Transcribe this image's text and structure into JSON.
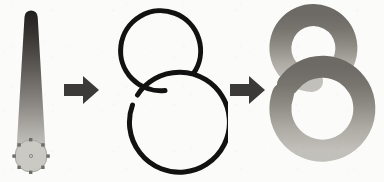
{
  "figure": {
    "background_color": "#fbfbf9",
    "width": 384,
    "height": 182,
    "panel_count": 3,
    "connector_count": 2
  },
  "panels": [
    {
      "id": "source",
      "name": "gradient-brush-stroke",
      "label": "Tapered gradient stroke with selected round end cap",
      "shape": "tapered-bar",
      "gradient": {
        "direction": "top-to-bottom",
        "stops": [
          {
            "offset": "0%",
            "color": "#211f1e"
          },
          {
            "offset": "18%",
            "color": "#383533"
          },
          {
            "offset": "42%",
            "color": "#5f5b57"
          },
          {
            "offset": "68%",
            "color": "#8d8a85"
          },
          {
            "offset": "88%",
            "color": "#b3b1ac"
          },
          {
            "offset": "100%",
            "color": "#c9c7c2"
          }
        ]
      },
      "top_width": 13,
      "bottom_width": 26,
      "selection": {
        "name": "selection-handles",
        "visible": true,
        "handle_color": "#6f6d69",
        "handle_count": 8,
        "center_marker": true,
        "circle_fill": "#cbc9c4",
        "circle_stroke": "#a8a6a1",
        "circle_radius": 16
      }
    },
    {
      "id": "path",
      "name": "figure-eight-outline-path",
      "label": "Open figure-eight outline path",
      "shape": "figure-eight",
      "stroke_color": "#131212",
      "stroke_width": 5,
      "fill": "none",
      "upper_loop": {
        "cx": 58,
        "cy": 52,
        "r": 40,
        "gap": "lower-right"
      },
      "lower_loop": {
        "cx": 55,
        "cy": 128,
        "r": 50,
        "gap": "upper-left"
      }
    },
    {
      "id": "result",
      "name": "gradient-applied-figure-eight",
      "label": "Gradient stroke applied along the figure-eight path",
      "shape": "figure-eight",
      "stroke_width": 22,
      "fill": "none",
      "gradient": {
        "direction": "top-to-bottom",
        "stops": [
          {
            "offset": "0%",
            "color": "#6d6a66"
          },
          {
            "offset": "22%",
            "color": "#78756f"
          },
          {
            "offset": "48%",
            "color": "#918e88"
          },
          {
            "offset": "72%",
            "color": "#adaaa4"
          },
          {
            "offset": "100%",
            "color": "#c2c0ba"
          }
        ]
      },
      "upper_loop": {
        "cx": 53,
        "cy": 48,
        "r": 33
      },
      "lower_loop": {
        "cx": 50,
        "cy": 122,
        "r": 42
      }
    }
  ],
  "connectors": [
    {
      "id": "arrow-1",
      "name": "flow-arrow-source-to-path",
      "direction": "right",
      "color": "#3b3a38",
      "from": "source",
      "to": "path"
    },
    {
      "id": "arrow-2",
      "name": "flow-arrow-path-to-result",
      "direction": "right",
      "color": "#3b3a38",
      "from": "path",
      "to": "result"
    }
  ],
  "colors": {
    "stroke_dark": "#131212",
    "arrow": "#3b3a38",
    "gradient_dark": "#211f1e",
    "gradient_light": "#c9c7c2",
    "result_dark": "#6d6a66",
    "result_light": "#c2c0ba",
    "background": "#fbfbf9"
  }
}
